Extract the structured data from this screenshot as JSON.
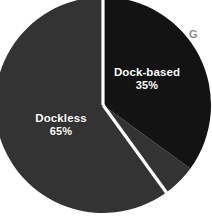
{
  "chart_data": {
    "type": "pie",
    "title": "",
    "categories": [
      "Dock-based",
      "Dockless"
    ],
    "values": [
      35,
      65
    ],
    "units": "%",
    "slices": [
      {
        "label": "Dock-based",
        "value": 35,
        "value_label": "35%",
        "color": "#131313",
        "start_angle_deg": 0,
        "end_angle_deg": 126
      },
      {
        "label": "Dockless",
        "value": 65,
        "value_label": "65%",
        "color": "#333333",
        "start_angle_deg": 126,
        "end_angle_deg": 360
      }
    ],
    "legend": "none",
    "data_labels": "inside-slice",
    "separator_color": "#ffffff",
    "background": "#ffffff"
  },
  "labels": {
    "dock_based": {
      "name": "Dock-based",
      "value": "35%"
    },
    "dockless": {
      "name": "Dockless",
      "value": "65%"
    }
  },
  "artifacts": {
    "edge_glyph": "G"
  },
  "colors": {
    "dock_based": "#131313",
    "dockless": "#333333",
    "background": "#ffffff",
    "label_text": "#ffffff",
    "edge_glyph": "#8e8e8e"
  }
}
